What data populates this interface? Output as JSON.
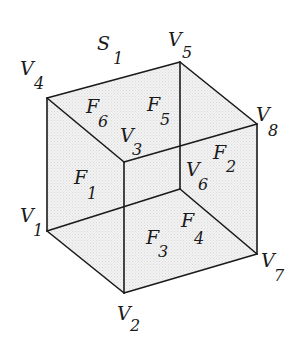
{
  "diagram": {
    "type": "cube-graph",
    "surface": {
      "letter": "S",
      "index": "1"
    },
    "vertices": [
      {
        "letter": "V",
        "index": "1"
      },
      {
        "letter": "V",
        "index": "2"
      },
      {
        "letter": "V",
        "index": "3"
      },
      {
        "letter": "V",
        "index": "4"
      },
      {
        "letter": "V",
        "index": "5"
      },
      {
        "letter": "V",
        "index": "6"
      },
      {
        "letter": "V",
        "index": "7"
      },
      {
        "letter": "V",
        "index": "8"
      }
    ],
    "faces": [
      {
        "letter": "F",
        "index": "1"
      },
      {
        "letter": "F",
        "index": "2"
      },
      {
        "letter": "F",
        "index": "3"
      },
      {
        "letter": "F",
        "index": "4"
      },
      {
        "letter": "F",
        "index": "5"
      },
      {
        "letter": "F",
        "index": "6"
      }
    ],
    "colors": {
      "stroke": "#1a1a1a",
      "fill": "#eeeeee",
      "background": "#ffffff"
    }
  }
}
